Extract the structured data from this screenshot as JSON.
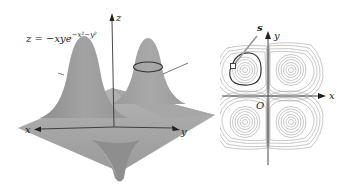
{
  "figure": {
    "surface_plot": {
      "formula": {
        "lhs": "z",
        "equals": "=",
        "rhs_base": "−xye",
        "rhs_exponent": "−x²−y²"
      },
      "axes": {
        "x_label": "x",
        "y_label": "y",
        "z_label": "z"
      },
      "colors": {
        "surface": "#9a9a9a",
        "surface_light": "#b8b8b8",
        "axis": "#333333",
        "level_curve": "#333333"
      }
    },
    "contour_plot": {
      "axes": {
        "x_label": "x",
        "y_label": "y",
        "origin_label": "O"
      },
      "point_label": "s",
      "colors": {
        "contour": "#9c9c9c",
        "highlight_curve": "#333333",
        "axis": "#333333"
      }
    }
  }
}
